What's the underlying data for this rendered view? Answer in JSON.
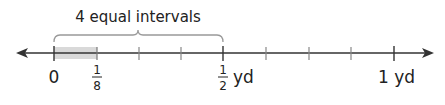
{
  "diagram": {
    "type": "number_line",
    "brace_label": "4 equal intervals",
    "unit": "yd",
    "range": [
      0,
      1
    ],
    "divisions": 8,
    "shaded_interval": [
      "0",
      "1/8"
    ],
    "labels": {
      "zero": "0",
      "eighth_num": "1",
      "eighth_den": "8",
      "half_num": "1",
      "half_den": "2",
      "half_unit": "yd",
      "one": "1 yd"
    },
    "colors": {
      "line": "#333333",
      "minor_tick": "#888888",
      "shade": "#d9d9d9",
      "brace": "#999999"
    }
  }
}
